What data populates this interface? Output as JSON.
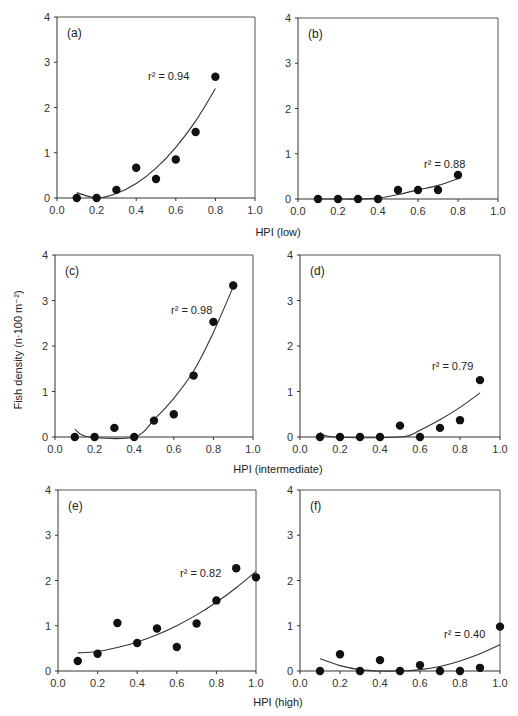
{
  "figure": {
    "ylabel": "Fish density (n·100 m⁻²)",
    "row_xlabels": [
      "HPI (low)",
      "HPI (intermediate)",
      "HPI (high)"
    ]
  },
  "chart_data": [
    {
      "type": "scatter",
      "panel": "(a)",
      "row_xlabel": "HPI (low)",
      "ylabel": "Fish density (n·100 m⁻²)",
      "x": [
        0.1,
        0.2,
        0.3,
        0.4,
        0.5,
        0.6,
        0.7,
        0.8
      ],
      "values": [
        0.0,
        0.0,
        0.18,
        0.67,
        0.42,
        0.85,
        1.46,
        2.68
      ],
      "fit": {
        "type": "quadratic",
        "r2_label": "r² = 0.94",
        "x": [
          0.1,
          0.2,
          0.3,
          0.4,
          0.5,
          0.6,
          0.7,
          0.8
        ],
        "y": [
          0.12,
          0.0,
          0.1,
          0.32,
          0.66,
          1.12,
          1.7,
          2.42
        ]
      },
      "xlim": [
        0.0,
        1.0
      ],
      "ylim": [
        0,
        4
      ],
      "xticks": [
        "0.0",
        "0.2",
        "0.4",
        "0.6",
        "0.8",
        "1.0"
      ],
      "yticks": [
        "0",
        "1",
        "2",
        "3",
        "4"
      ],
      "grid": false
    },
    {
      "type": "scatter",
      "panel": "(b)",
      "row_xlabel": "HPI (low)",
      "x": [
        0.1,
        0.2,
        0.3,
        0.4,
        0.5,
        0.6,
        0.7,
        0.8
      ],
      "values": [
        0.0,
        0.0,
        0.0,
        0.0,
        0.2,
        0.2,
        0.2,
        0.53
      ],
      "fit": {
        "type": "quadratic",
        "r2_label": "r² = 0.88",
        "x": [
          0.1,
          0.2,
          0.3,
          0.4,
          0.5,
          0.6,
          0.7,
          0.8
        ],
        "y": [
          0.0,
          0.0,
          0.0,
          0.02,
          0.1,
          0.2,
          0.3,
          0.45
        ]
      },
      "xlim": [
        0.0,
        1.0
      ],
      "ylim": [
        0,
        4
      ],
      "xticks": [
        "0.0",
        "0.2",
        "0.4",
        "0.6",
        "0.8",
        "1.0"
      ],
      "yticks": [
        "0",
        "1",
        "2",
        "3",
        "4"
      ],
      "grid": false
    },
    {
      "type": "scatter",
      "panel": "(c)",
      "row_xlabel": "HPI (intermediate)",
      "x": [
        0.1,
        0.2,
        0.3,
        0.4,
        0.5,
        0.6,
        0.7,
        0.8,
        0.9
      ],
      "values": [
        0.0,
        0.0,
        0.2,
        0.0,
        0.36,
        0.5,
        1.35,
        2.53,
        3.33
      ],
      "fit": {
        "type": "quadratic",
        "r2_label": "r² = 0.98",
        "x": [
          0.1,
          0.17,
          0.4,
          0.5,
          0.6,
          0.7,
          0.8,
          0.9
        ],
        "y": [
          0.17,
          0.0,
          0.0,
          0.38,
          0.85,
          1.45,
          2.3,
          3.3
        ]
      },
      "xlim": [
        0.0,
        1.0
      ],
      "ylim": [
        0,
        4
      ],
      "xticks": [
        "0.0",
        "0.2",
        "0.4",
        "0.6",
        "0.8",
        "1.0"
      ],
      "yticks": [
        "0",
        "1",
        "2",
        "3",
        "4"
      ],
      "grid": false
    },
    {
      "type": "scatter",
      "panel": "(d)",
      "row_xlabel": "HPI (intermediate)",
      "x": [
        0.1,
        0.2,
        0.3,
        0.4,
        0.5,
        0.6,
        0.7,
        0.8,
        0.9
      ],
      "values": [
        0.0,
        0.0,
        0.0,
        0.0,
        0.25,
        0.0,
        0.2,
        0.37,
        1.25
      ],
      "fit": {
        "type": "quadratic",
        "r2_label": "r² = 0.79",
        "x": [
          0.1,
          0.17,
          0.5,
          0.6,
          0.7,
          0.8,
          0.9
        ],
        "y": [
          0.1,
          0.0,
          0.0,
          0.15,
          0.38,
          0.65,
          0.97
        ]
      },
      "xlim": [
        0.0,
        1.0
      ],
      "ylim": [
        0,
        4
      ],
      "xticks": [
        "0.0",
        "0.2",
        "0.4",
        "0.6",
        "0.8",
        "1.0"
      ],
      "yticks": [
        "0",
        "1",
        "2",
        "3",
        "4"
      ],
      "grid": false
    },
    {
      "type": "scatter",
      "panel": "(e)",
      "row_xlabel": "HPI (high)",
      "x": [
        0.1,
        0.2,
        0.3,
        0.4,
        0.5,
        0.6,
        0.7,
        0.8,
        0.9,
        1.0
      ],
      "values": [
        0.22,
        0.38,
        1.06,
        0.62,
        0.94,
        0.53,
        1.05,
        1.56,
        2.27,
        2.07
      ],
      "fit": {
        "type": "quadratic",
        "r2_label": "r² = 0.82",
        "x": [
          0.1,
          0.2,
          0.3,
          0.4,
          0.5,
          0.6,
          0.7,
          0.8,
          0.9,
          1.0
        ],
        "y": [
          0.4,
          0.43,
          0.52,
          0.64,
          0.8,
          1.0,
          1.24,
          1.52,
          1.84,
          2.2
        ]
      },
      "xlim": [
        0.0,
        1.0
      ],
      "ylim": [
        0,
        4
      ],
      "xticks": [
        "0.0",
        "0.2",
        "0.4",
        "0.6",
        "0.8",
        "1.0"
      ],
      "yticks": [
        "0",
        "1",
        "2",
        "3",
        "4"
      ],
      "grid": false
    },
    {
      "type": "scatter",
      "panel": "(f)",
      "row_xlabel": "HPI (high)",
      "x": [
        0.1,
        0.2,
        0.3,
        0.4,
        0.5,
        0.6,
        0.7,
        0.8,
        0.9,
        1.0
      ],
      "values": [
        0.0,
        0.37,
        0.0,
        0.24,
        0.0,
        0.13,
        0.0,
        0.0,
        0.07,
        0.98
      ],
      "fit": {
        "type": "quadratic",
        "r2_label": "r² = 0.40",
        "x": [
          0.1,
          0.2,
          0.3,
          0.4,
          0.5,
          0.6,
          0.7,
          0.8,
          0.9,
          1.0
        ],
        "y": [
          0.27,
          0.12,
          0.03,
          0.0,
          0.0,
          0.03,
          0.1,
          0.22,
          0.38,
          0.58
        ]
      },
      "xlim": [
        0.0,
        1.0
      ],
      "ylim": [
        0,
        4
      ],
      "xticks": [
        "0.0",
        "0.2",
        "0.4",
        "0.6",
        "0.8",
        "1.0"
      ],
      "yticks": [
        "0",
        "1",
        "2",
        "3",
        "4"
      ],
      "grid": false
    }
  ]
}
